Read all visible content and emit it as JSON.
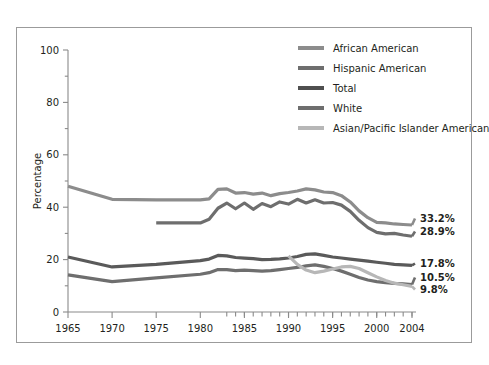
{
  "chart_data": {
    "type": "line",
    "title": "",
    "xlabel": "",
    "ylabel": "Percentage",
    "xlim": [
      1965,
      2004
    ],
    "ylim": [
      0,
      100
    ],
    "grid": false,
    "legend_position": "top-right",
    "y_ticks_major": [
      0,
      20,
      40,
      60,
      80,
      100
    ],
    "y_ticks_minor": [
      10,
      30,
      50,
      70,
      90
    ],
    "x_ticks_major": [
      1965,
      1970,
      1975,
      1980,
      1985,
      1990,
      1995,
      2000,
      2004
    ],
    "x_ticks_minor": [
      1983,
      1984,
      1985,
      1986,
      1987,
      1988,
      1989,
      1990,
      1991,
      1992,
      1993,
      1994,
      1995,
      1996,
      1997,
      1998,
      1999,
      2000,
      2001,
      2002,
      2003,
      2004
    ],
    "series": [
      {
        "name": "African American",
        "color": "#8c8c8c",
        "end_label": "33.2%",
        "x": [
          1965,
          1970,
          1975,
          1980,
          1981,
          1982,
          1983,
          1984,
          1985,
          1986,
          1987,
          1988,
          1989,
          1990,
          1991,
          1992,
          1993,
          1994,
          1995,
          1996,
          1997,
          1998,
          1999,
          2000,
          2001,
          2002,
          2003,
          2004
        ],
        "values": [
          48.0,
          43.0,
          42.8,
          42.8,
          43.2,
          46.8,
          47.0,
          45.4,
          45.6,
          45.0,
          45.4,
          44.4,
          45.2,
          45.6,
          46.2,
          47.0,
          46.6,
          45.8,
          45.6,
          44.4,
          42.0,
          38.6,
          36.0,
          34.2,
          34.0,
          33.6,
          33.4,
          33.2
        ]
      },
      {
        "name": "Hispanic American",
        "color": "#6e6e6e",
        "end_label": "28.9%",
        "x": [
          1975,
          1980,
          1981,
          1982,
          1983,
          1984,
          1985,
          1986,
          1987,
          1988,
          1989,
          1990,
          1991,
          1992,
          1993,
          1994,
          1995,
          1996,
          1997,
          1998,
          1999,
          2000,
          2001,
          2002,
          2003,
          2004
        ],
        "values": [
          34.0,
          34.0,
          35.4,
          39.6,
          41.6,
          39.4,
          41.6,
          39.2,
          41.4,
          40.2,
          42.0,
          41.2,
          43.0,
          41.6,
          42.8,
          41.6,
          41.8,
          40.8,
          38.4,
          35.0,
          32.2,
          30.4,
          29.8,
          30.0,
          29.4,
          28.9
        ]
      },
      {
        "name": "Total",
        "color": "#5a5a5a",
        "end_label": "17.8%",
        "x": [
          1965,
          1970,
          1975,
          1980,
          1981,
          1982,
          1983,
          1984,
          1985,
          1986,
          1987,
          1988,
          1989,
          1990,
          1991,
          1992,
          1993,
          1994,
          1995,
          1996,
          1997,
          1998,
          1999,
          2000,
          2001,
          2002,
          2003,
          2004
        ],
        "values": [
          21.0,
          17.2,
          18.2,
          19.6,
          20.2,
          21.6,
          21.4,
          20.8,
          20.6,
          20.4,
          20.0,
          20.1,
          20.3,
          20.6,
          21.2,
          22.0,
          22.2,
          21.6,
          21.0,
          20.6,
          20.2,
          19.8,
          19.4,
          19.0,
          18.6,
          18.2,
          18.0,
          17.8
        ]
      },
      {
        "name": "White",
        "color": "#6e6e6e",
        "end_label": "10.5%",
        "x": [
          1965,
          1970,
          1975,
          1980,
          1981,
          1982,
          1983,
          1984,
          1985,
          1986,
          1987,
          1988,
          1989,
          1990,
          1991,
          1992,
          1993,
          1994,
          1995,
          1996,
          1997,
          1998,
          1999,
          2000,
          2001,
          2002,
          2003,
          2004
        ],
        "values": [
          14.2,
          11.6,
          13.0,
          14.4,
          15.0,
          16.2,
          16.2,
          15.8,
          16.0,
          15.8,
          15.6,
          15.8,
          16.2,
          16.6,
          17.0,
          17.6,
          18.0,
          17.4,
          16.6,
          15.6,
          14.4,
          13.2,
          12.2,
          11.6,
          11.2,
          10.9,
          10.7,
          10.5
        ]
      },
      {
        "name": "Asian/Pacific Islander American",
        "color": "#b7b7b7",
        "end_label": "9.8%",
        "x": [
          1990,
          1991,
          1992,
          1993,
          1994,
          1995,
          1996,
          1997,
          1998,
          1999,
          2000,
          2001,
          2002,
          2003,
          2004
        ],
        "values": [
          21.4,
          18.2,
          16.0,
          15.0,
          15.6,
          16.4,
          17.2,
          17.4,
          16.6,
          15.0,
          13.4,
          12.0,
          11.0,
          10.4,
          9.8
        ]
      }
    ]
  },
  "legend": {
    "items": [
      {
        "label": "African American",
        "color": "#8c8c8c"
      },
      {
        "label": "Hispanic American",
        "color": "#6e6e6e"
      },
      {
        "label": "Total",
        "color": "#4f4f4f"
      },
      {
        "label": "White",
        "color": "#6e6e6e"
      },
      {
        "label": "Asian/Pacific Islander American",
        "color": "#b7b7b7"
      }
    ]
  },
  "axes": {
    "y_title": "Percentage",
    "y_tick_labels": [
      "0",
      "20",
      "40",
      "60",
      "80",
      "100"
    ],
    "x_tick_labels": [
      "1965",
      "1970",
      "1975",
      "1980",
      "1985",
      "1990",
      "1995",
      "2000",
      "2004"
    ]
  },
  "end_labels": [
    "33.2%",
    "28.9%",
    "17.8%",
    "10.5%",
    "9.8%"
  ]
}
